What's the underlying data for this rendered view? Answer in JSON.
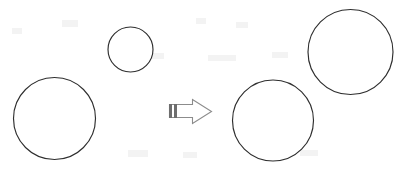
{
  "canvas": {
    "width": 399,
    "height": 172,
    "background_color": "#ffffff",
    "title": "Circle transformation diagram"
  },
  "style": {
    "circle_stroke_color": "#2e2e2e",
    "circle_fill_color": "#ffffff",
    "circle_stroke_width": 1.15,
    "arrow_stroke_color": "#8c8c8c",
    "arrow_fill_color": "#ffffff",
    "arrow_tail_bar_color": "#6e6e6e"
  },
  "chart_data": {
    "type": "diagram",
    "groups": [
      {
        "name": "before",
        "side": "left",
        "circle_count": 2
      },
      {
        "name": "after",
        "side": "right",
        "circle_count": 2
      }
    ],
    "shapes": [
      {
        "id": "circle-left-small",
        "kind": "circle",
        "group": "before",
        "label": "small circle",
        "cx": 130.5,
        "cy": 49.5,
        "r": 22.5
      },
      {
        "id": "circle-left-large",
        "kind": "circle",
        "group": "before",
        "label": "large circle",
        "cx": 54.5,
        "cy": 118.5,
        "r": 41.0
      },
      {
        "id": "circle-right-lower",
        "kind": "circle",
        "group": "after",
        "label": "large circle",
        "cx": 273.0,
        "cy": 120.5,
        "r": 40.5
      },
      {
        "id": "circle-right-upper",
        "kind": "circle",
        "group": "after",
        "label": "large circle",
        "cx": 350.5,
        "cy": 52.0,
        "r": 42.5
      }
    ],
    "arrow": {
      "id": "transform-arrow",
      "kind": "block-arrow",
      "direction": "right",
      "x": 168,
      "y": 98,
      "width": 45,
      "height": 26,
      "shaft_top": 104,
      "shaft_bottom": 117,
      "head_start_x": 192,
      "head_top": 99,
      "head_bottom": 123,
      "tip_x": 212,
      "tail_bars": 2
    }
  },
  "accessibility": {
    "arrow_alt": "right pointing block arrow with striped tail",
    "circle_alt": "outlined circle"
  }
}
